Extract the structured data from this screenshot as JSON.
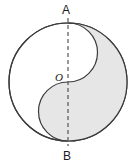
{
  "figure": {
    "type": "taijitu-in-circle",
    "labels": {
      "top": "A",
      "center": "O",
      "bottom": "B"
    },
    "colors": {
      "stroke": "#3a3a3a",
      "shaded_fill": "#e6e6e6",
      "unshaded_fill": "#ffffff",
      "dash_stroke": "#555555",
      "label_text": "#1a1a1a"
    },
    "geometry": {
      "center_x": 68,
      "center_y": 82,
      "radius": 59,
      "small_radius": 29.5,
      "diameter_endpoint_top_y": 23,
      "diameter_endpoint_bottom_y": 141,
      "stroke_width": 1.2,
      "dash_pattern": "4 3"
    }
  }
}
